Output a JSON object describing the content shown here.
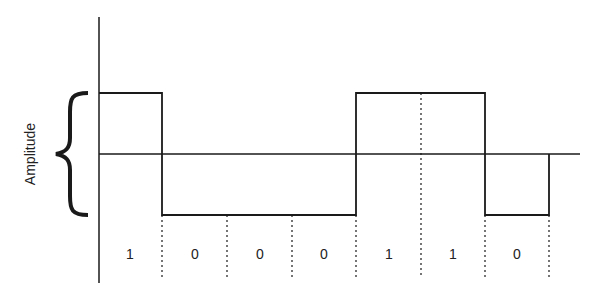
{
  "diagram": {
    "type": "digital-signal-waveform",
    "y_label": "Amplitude",
    "bits": [
      "1",
      "0",
      "0",
      "0",
      "1",
      "1",
      "0"
    ],
    "levels": {
      "1": "high",
      "0": "low"
    },
    "colors": {
      "line": "#1a1a1a",
      "background": "#ffffff"
    }
  }
}
